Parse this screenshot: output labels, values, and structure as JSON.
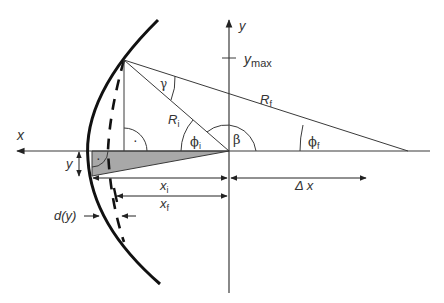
{
  "figure": {
    "axes": {
      "x_label": "x",
      "y_label": "y",
      "y_tick_label": "y",
      "y_tick_sub": "max"
    },
    "labels": {
      "gamma": "γ",
      "R_i": "R",
      "R_i_sub": "i",
      "R_f": "R",
      "R_f_sub": "f",
      "phi_i": "ϕ",
      "phi_i_sub": "i",
      "phi_f": "ϕ",
      "phi_f_sub": "f",
      "beta": "β",
      "right_angle_dot": "·",
      "y_dim": "y",
      "x_i": "x",
      "x_i_sub": "i",
      "x_f": "x",
      "x_f_sub": "f",
      "delta_x": "Δ x",
      "d_of_y": "d(y)"
    },
    "colors": {
      "line": "#3a3a3a",
      "thick_curve": "#111111",
      "shade": "#a8a8a8",
      "text": "#333333"
    }
  }
}
